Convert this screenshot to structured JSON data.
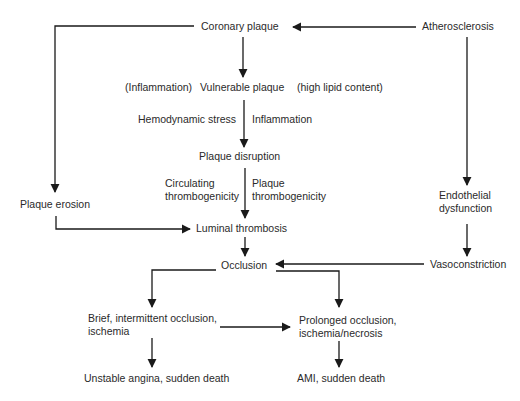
{
  "diagram": {
    "type": "flowchart",
    "nodes": {
      "coronary_plaque": "Coronary plaque",
      "atherosclerosis": "Atherosclerosis",
      "vulnerable_plaque": "Vulnerable plaque",
      "plaque_disruption": "Plaque disruption",
      "plaque_erosion": "Plaque erosion",
      "endothelial_dysfunction_1": "Endothelial",
      "endothelial_dysfunction_2": "dysfunction",
      "luminal_thrombosis": "Luminal thrombosis",
      "occlusion": "Occlusion",
      "vasoconstriction": "Vasoconstriction",
      "brief_occlusion_1": "Brief, intermittent occlusion,",
      "brief_occlusion_2": "ischemia",
      "prolonged_occlusion_1": "Prolonged occlusion,",
      "prolonged_occlusion_2": "ischemia/necrosis",
      "unstable_angina": "Unstable angina, sudden death",
      "ami": "AMI, sudden death"
    },
    "labels": {
      "inflammation_paren": "(Inflammation)",
      "high_lipid": "(high lipid content)",
      "hemodynamic_stress": "Hemodynamic stress",
      "inflammation": "Inflammation",
      "circulating_1": "Circulating",
      "circulating_2": "thrombogenicity",
      "plaque_thromb_1": "Plaque",
      "plaque_thromb_2": "thrombogenicity"
    },
    "edges": [
      [
        "Atherosclerosis",
        "Coronary plaque"
      ],
      [
        "Coronary plaque",
        "Vulnerable plaque"
      ],
      [
        "Coronary plaque",
        "Plaque erosion"
      ],
      [
        "Vulnerable plaque",
        "Plaque disruption"
      ],
      [
        "Plaque disruption",
        "Luminal thrombosis"
      ],
      [
        "Plaque erosion",
        "Luminal thrombosis"
      ],
      [
        "Atherosclerosis",
        "Endothelial dysfunction"
      ],
      [
        "Endothelial dysfunction",
        "Vasoconstriction"
      ],
      [
        "Vasoconstriction",
        "Occlusion"
      ],
      [
        "Luminal thrombosis",
        "Occlusion"
      ],
      [
        "Occlusion",
        "Brief, intermittent occlusion, ischemia"
      ],
      [
        "Occlusion",
        "Prolonged occlusion, ischemia/necrosis"
      ],
      [
        "Brief, intermittent occlusion, ischemia",
        "Prolonged occlusion, ischemia/necrosis"
      ],
      [
        "Brief, intermittent occlusion, ischemia",
        "Unstable angina, sudden death"
      ],
      [
        "Prolonged occlusion, ischemia/necrosis",
        "AMI, sudden death"
      ]
    ],
    "colors": {
      "line": "#1a1a1a",
      "text": "#2a2a2a"
    }
  }
}
